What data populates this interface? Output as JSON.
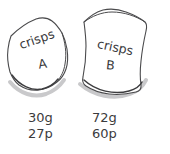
{
  "scene": {
    "title": "Two crisp packets comparison",
    "background_color": "#ffffff",
    "ink_color": "#3a3a3c",
    "outline_color": "#4a4a4c",
    "shadow_color": "#3d3d3f"
  },
  "packets": [
    {
      "id": "a",
      "brand": "crisps",
      "letter": "A",
      "weight": "30g",
      "price": "27p"
    },
    {
      "id": "b",
      "brand": "crisps",
      "letter": "B",
      "weight": "72g",
      "price": "60p"
    }
  ],
  "captions": {
    "a": {
      "weight": "30g",
      "price": "27p"
    },
    "b": {
      "weight": "72g",
      "price": "60p"
    }
  }
}
